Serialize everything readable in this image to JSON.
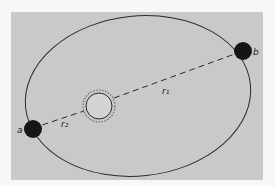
{
  "diagram": {
    "type": "elliptical-orbit",
    "colors": {
      "background": "#f7f7f7",
      "panel": "#c9c9c9",
      "orbit_stroke": "#2a2a2a",
      "planet_fill": "#151515",
      "sun_fill": "#d4d4d4"
    },
    "labels": {
      "point_a": "a",
      "point_b": "b",
      "radius_1": "r₁",
      "radius_2": "r₂"
    }
  }
}
